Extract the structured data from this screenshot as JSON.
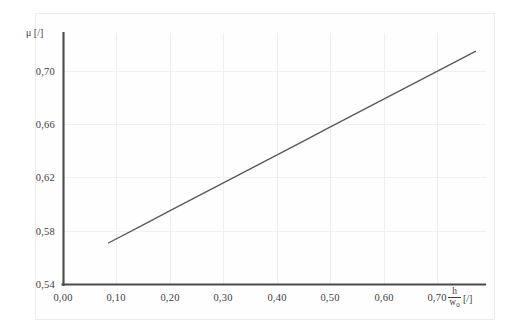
{
  "figure": {
    "background_color": "#ffffff",
    "frame_color": "#ececec",
    "axis_color": "#4a4a4a",
    "grid_color": "#eeeeee",
    "line_color": "#5a5a5a"
  },
  "axes": {
    "y_title": "μ [/]",
    "x_title_numerator": "h",
    "x_title_denominator": "w",
    "x_title_denominator_sub": "0",
    "x_title_unit": "[/]"
  },
  "chart_data": {
    "type": "line",
    "title": "",
    "subtitle": "",
    "xlabel": "h/w₀ [/]",
    "ylabel": "μ [/]",
    "xlim": [
      0.0,
      0.8
    ],
    "ylim": [
      0.54,
      0.74
    ],
    "grid": true,
    "legend": "none",
    "x_ticks": [
      0.0,
      0.1,
      0.2,
      0.3,
      0.4,
      0.5,
      0.6,
      0.7
    ],
    "x_tick_labels": [
      "0,00",
      "0,10",
      "0,20",
      "0,30",
      "0,40",
      "0,50",
      "0,60",
      "0,70"
    ],
    "y_ticks": [
      0.54,
      0.58,
      0.62,
      0.66,
      0.7
    ],
    "y_tick_labels": [
      "0,54",
      "0,58",
      "0,62",
      "0,66",
      "0,70"
    ],
    "series": [
      {
        "name": "mu",
        "x": [
          0.085,
          0.15,
          0.2,
          0.25,
          0.3,
          0.35,
          0.4,
          0.45,
          0.5,
          0.55,
          0.6,
          0.65,
          0.7,
          0.78
        ],
        "y": [
          0.573,
          0.5873,
          0.5983,
          0.6093,
          0.6202,
          0.6312,
          0.6421,
          0.6531,
          0.6641,
          0.675,
          0.686,
          0.6969,
          0.7079,
          0.7254
        ]
      }
    ]
  }
}
